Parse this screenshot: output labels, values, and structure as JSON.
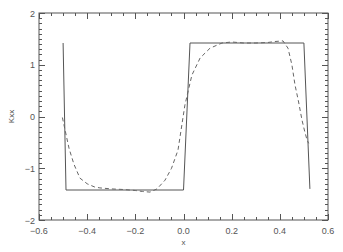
{
  "chart_data": {
    "type": "line",
    "title": "",
    "xlabel": "x",
    "ylabel": "Kxx",
    "xlim": [
      -0.6,
      0.6
    ],
    "ylim": [
      -2,
      2
    ],
    "grid": false,
    "legend": null,
    "xticks": [
      -0.6,
      -0.4,
      -0.2,
      0.0,
      0.2,
      0.4,
      0.6
    ],
    "xtick_labels": [
      "−0.6",
      "−0.4",
      "−0.2",
      "0.0",
      "0.2",
      "0.4",
      "0.6"
    ],
    "yticks": [
      -2,
      -1,
      0,
      1,
      2
    ],
    "ytick_labels": [
      "−2",
      "−1",
      "0",
      "1",
      "2"
    ],
    "x_minor_step": 0.05,
    "y_minor_step": 0.1,
    "series": [
      {
        "name": "exact (square wave)",
        "style": "solid",
        "color": "#555555",
        "x": [
          -0.5,
          -0.488,
          0.0,
          0.027,
          0.5,
          0.525
        ],
        "y": [
          1.42,
          -1.42,
          -1.42,
          1.42,
          1.42,
          -1.4
        ]
      },
      {
        "name": "approximation",
        "style": "dashed",
        "color": "#666666",
        "x": [
          -0.503,
          -0.49,
          -0.475,
          -0.455,
          -0.43,
          -0.4,
          -0.37,
          -0.347,
          -0.3,
          -0.25,
          -0.2,
          -0.17,
          -0.139,
          -0.11,
          -0.077,
          -0.05,
          -0.023,
          0.006,
          0.035,
          0.069,
          0.11,
          0.16,
          0.2,
          0.25,
          0.3,
          0.35,
          0.38,
          0.413,
          0.434,
          0.45,
          0.463,
          0.478,
          0.492,
          0.503,
          0.513,
          0.52
        ],
        "y": [
          -0.02,
          -0.3,
          -0.62,
          -0.92,
          -1.19,
          -1.3,
          -1.36,
          -1.38,
          -1.4,
          -1.41,
          -1.43,
          -1.45,
          -1.46,
          -1.4,
          -1.23,
          -1.0,
          -0.65,
          0.22,
          0.8,
          1.13,
          1.32,
          1.42,
          1.44,
          1.42,
          1.42,
          1.43,
          1.45,
          1.46,
          1.32,
          1.0,
          0.61,
          0.28,
          -0.07,
          -0.28,
          -0.45,
          -0.52
        ]
      }
    ]
  }
}
